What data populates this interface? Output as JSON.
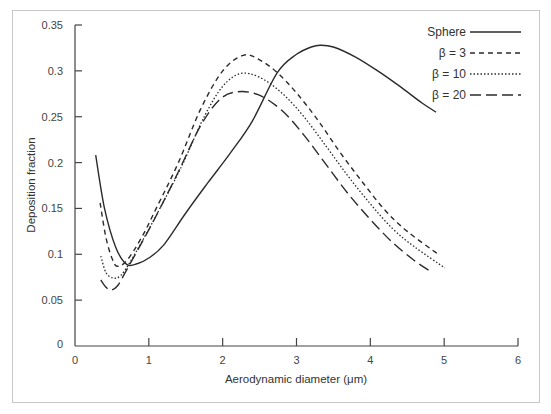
{
  "chart_data": {
    "type": "line",
    "title": "",
    "xlabel": "Aerodynamic diameter (μm)",
    "ylabel": "Deposition fraction",
    "xlim": [
      0,
      6
    ],
    "ylim": [
      0,
      0.35
    ],
    "x_ticks": [
      "0",
      "1",
      "2",
      "3",
      "4",
      "5",
      "6"
    ],
    "y_ticks": [
      "0",
      "0.05",
      "0.1",
      "0.15",
      "0.2",
      "0.25",
      "0.3",
      "0.35"
    ],
    "grid": false,
    "legend_position": "upper right",
    "series": [
      {
        "name": "Sphere",
        "style": "solid",
        "x": [
          0.28,
          0.4,
          0.55,
          0.7,
          0.85,
          1.0,
          1.2,
          1.5,
          1.8,
          2.1,
          2.4,
          2.74,
          3.0,
          3.2,
          3.32,
          3.5,
          3.8,
          4.1,
          4.4,
          4.7,
          4.89
        ],
        "y": [
          0.208,
          0.15,
          0.108,
          0.089,
          0.09,
          0.096,
          0.11,
          0.145,
          0.178,
          0.21,
          0.245,
          0.298,
          0.318,
          0.326,
          0.328,
          0.326,
          0.315,
          0.3,
          0.283,
          0.265,
          0.255
        ]
      },
      {
        "name": "β = 3",
        "style": "dashed",
        "x": [
          0.34,
          0.42,
          0.5,
          0.57,
          0.7,
          0.9,
          1.1,
          1.4,
          1.7,
          2.0,
          2.28,
          2.5,
          2.74,
          3.0,
          3.3,
          3.6,
          3.9,
          4.2,
          4.5,
          4.92
        ],
        "y": [
          0.156,
          0.118,
          0.096,
          0.087,
          0.093,
          0.118,
          0.15,
          0.2,
          0.258,
          0.3,
          0.317,
          0.312,
          0.298,
          0.276,
          0.245,
          0.21,
          0.178,
          0.148,
          0.125,
          0.1
        ]
      },
      {
        "name": "β = 10",
        "style": "dotted",
        "x": [
          0.35,
          0.42,
          0.52,
          0.62,
          0.75,
          0.95,
          1.15,
          1.45,
          1.75,
          2.0,
          2.24,
          2.5,
          2.8,
          3.1,
          3.4,
          3.7,
          4.0,
          4.3,
          4.6,
          5.01
        ],
        "y": [
          0.098,
          0.08,
          0.074,
          0.077,
          0.092,
          0.12,
          0.15,
          0.197,
          0.25,
          0.283,
          0.297,
          0.293,
          0.276,
          0.25,
          0.218,
          0.185,
          0.155,
          0.128,
          0.108,
          0.085
        ]
      },
      {
        "name": "β = 20",
        "style": "long-dashed",
        "x": [
          0.35,
          0.42,
          0.49,
          0.58,
          0.7,
          0.9,
          1.1,
          1.4,
          1.7,
          1.95,
          2.18,
          2.48,
          2.8,
          3.1,
          3.4,
          3.7,
          4.0,
          4.3,
          4.6,
          4.84
        ],
        "y": [
          0.072,
          0.064,
          0.061,
          0.066,
          0.083,
          0.112,
          0.142,
          0.19,
          0.24,
          0.268,
          0.277,
          0.274,
          0.257,
          0.23,
          0.198,
          0.166,
          0.138,
          0.113,
          0.093,
          0.08
        ]
      }
    ]
  },
  "legend": {
    "items": [
      {
        "label": "Sphere"
      },
      {
        "label": "β = 3"
      },
      {
        "label": "β = 10"
      },
      {
        "label": "β = 20"
      }
    ]
  },
  "colors": {
    "line": "#2b2b2b",
    "axis": "#444444",
    "frame": "#c8c8c8"
  }
}
